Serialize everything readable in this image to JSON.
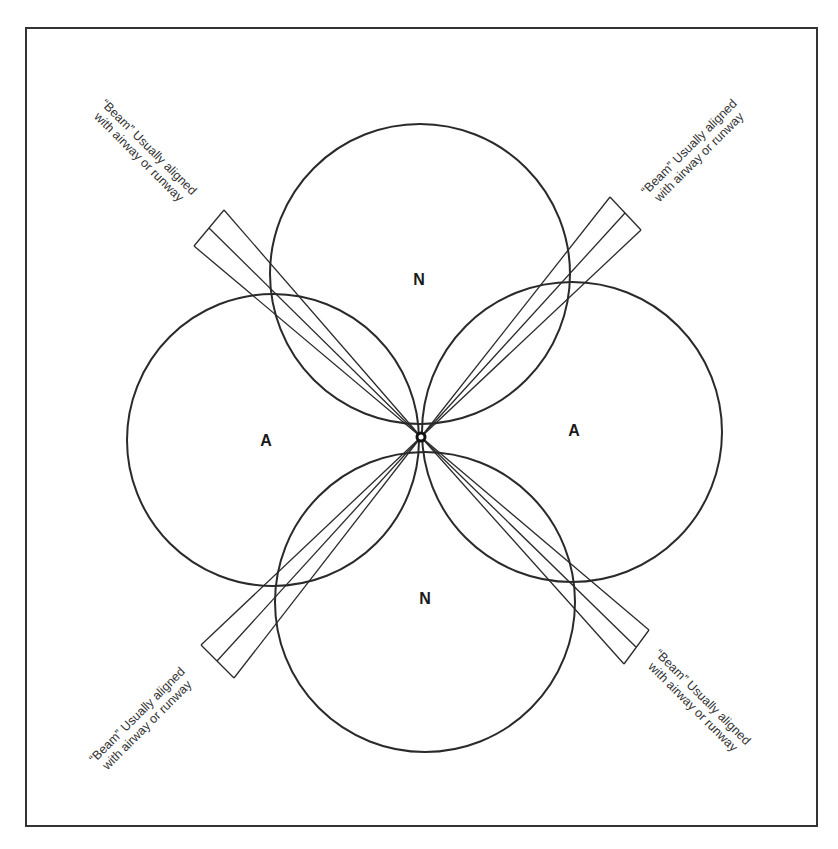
{
  "diagram": {
    "type": "radio-antenna-lobe-pattern",
    "lobes": [
      {
        "id": "top",
        "label": "N"
      },
      {
        "id": "left",
        "label": "A"
      },
      {
        "id": "right",
        "label": "A"
      },
      {
        "id": "bottom",
        "label": "N"
      }
    ],
    "beams": [
      {
        "id": "top-left",
        "note_line1": "“Beam” Usually aligned",
        "note_line2": "with airway or runway"
      },
      {
        "id": "top-right",
        "note_line1": "“Beam” Usually aligned",
        "note_line2": "with airway or runway"
      },
      {
        "id": "bottom-left",
        "note_line1": "“Beam” Usually aligned",
        "note_line2": "with airway or runway"
      },
      {
        "id": "bottom-right",
        "note_line1": "“Beam” Usually aligned",
        "note_line2": "with airway or runway"
      }
    ],
    "colors": {
      "stroke": "#2a2a2a",
      "background": "#ffffff"
    }
  }
}
